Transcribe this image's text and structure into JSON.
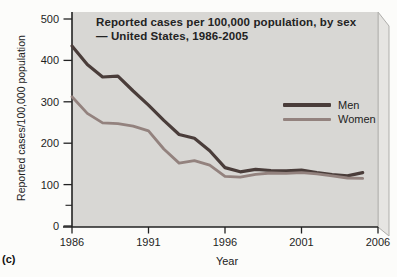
{
  "figure_label": "(c)",
  "title": {
    "line1": "Reported cases per 100,000 population, by sex",
    "line2": "— United States, 1986-2005"
  },
  "axes": {
    "y_label": "Reported cases/100,000 population",
    "x_label": "Year"
  },
  "colors": {
    "plot_background": "#d8d7d4",
    "slab_side": "#e6e5e2",
    "slab_edge": "#aeadaa",
    "axis": "#222222",
    "men_line": "#4a3d3a",
    "women_line": "#93827e",
    "page_background": "#fcfcfa"
  },
  "chart_data": {
    "type": "line",
    "title": "Reported cases per 100,000 population, by sex — United States, 1986-2005",
    "xlabel": "Year",
    "ylabel": "Reported cases/100,000 population",
    "xlim": [
      1986,
      2006
    ],
    "ylim": [
      0,
      500
    ],
    "x_ticks": [
      1986,
      1991,
      1996,
      2001,
      2006
    ],
    "y_ticks": [
      0,
      100,
      200,
      300,
      400,
      500
    ],
    "y_minor_ticks": [
      50
    ],
    "grid": "off",
    "legend_position": "right-center-inside",
    "x": [
      1986,
      1987,
      1988,
      1989,
      1990,
      1991,
      1992,
      1993,
      1994,
      1995,
      1996,
      1997,
      1998,
      1999,
      2000,
      2001,
      2002,
      2003,
      2004,
      2005
    ],
    "series": [
      {
        "name": "Men",
        "color": "#4a3d3a",
        "values": [
          435,
          390,
          360,
          362,
          326,
          292,
          255,
          221,
          212,
          182,
          141,
          131,
          137,
          134,
          133,
          135,
          129,
          124,
          121,
          129
        ]
      },
      {
        "name": "Women",
        "color": "#93827e",
        "values": [
          312,
          272,
          249,
          247,
          241,
          230,
          186,
          152,
          158,
          147,
          120,
          118,
          125,
          128,
          127,
          129,
          126,
          121,
          116,
          115
        ]
      }
    ]
  }
}
